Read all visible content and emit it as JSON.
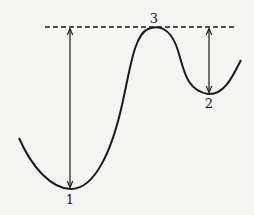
{
  "diagram": {
    "type": "potential-energy-curve",
    "points": [
      {
        "id": "1",
        "label": "1",
        "kind": "global-minimum"
      },
      {
        "id": "2",
        "label": "2",
        "kind": "local-minimum"
      },
      {
        "id": "3",
        "label": "3",
        "kind": "maximum"
      }
    ],
    "reference_line": {
      "style": "dashed",
      "level": "maximum-3"
    },
    "arrows": [
      {
        "from": "3",
        "to": "1",
        "direction": "double-headed"
      },
      {
        "from": "3",
        "to": "2",
        "direction": "double-headed"
      }
    ],
    "colors": {
      "line": "#1a1a1a",
      "background": "#f4f4f2"
    }
  }
}
